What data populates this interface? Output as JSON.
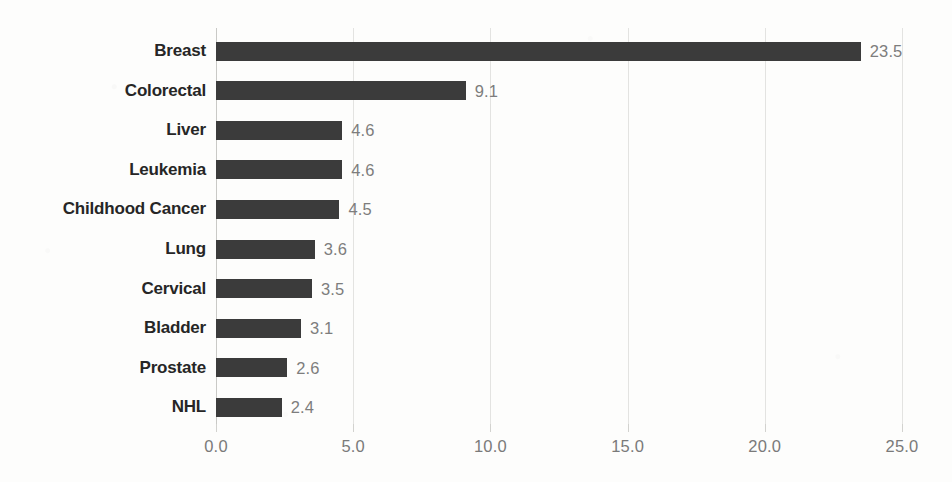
{
  "chart_data": {
    "type": "bar",
    "orientation": "horizontal",
    "title": "",
    "subtitle": "",
    "xlabel": "",
    "ylabel": "",
    "xlim": [
      0.0,
      25.0
    ],
    "grid": true,
    "legend": null,
    "legend_position": "none",
    "xticks": [
      "0.0",
      "5.0",
      "10.0",
      "15.0",
      "20.0",
      "25.0"
    ],
    "xtick_values": [
      0.0,
      5.0,
      10.0,
      15.0,
      20.0,
      25.0
    ],
    "categories": [
      "Breast",
      "Colorectal",
      "Liver",
      "Leukemia",
      "Childhood Cancer",
      "Lung",
      "Cervical",
      "Bladder",
      "Prostate",
      "NHL"
    ],
    "values": [
      23.5,
      9.1,
      4.6,
      4.6,
      4.5,
      3.6,
      3.5,
      3.1,
      2.6,
      2.4
    ],
    "value_labels": [
      "23.5",
      "9.1",
      "4.6",
      "4.6",
      "4.5",
      "3.6",
      "3.5",
      "3.1",
      "2.6",
      "2.4"
    ],
    "bars": [
      {
        "category": "Breast",
        "value": 23.5,
        "label": "23.5"
      },
      {
        "category": "Colorectal",
        "value": 9.1,
        "label": "9.1"
      },
      {
        "category": "Liver",
        "value": 4.6,
        "label": "4.6"
      },
      {
        "category": "Leukemia",
        "value": 4.6,
        "label": "4.6"
      },
      {
        "category": "Childhood Cancer",
        "value": 4.5,
        "label": "4.5"
      },
      {
        "category": "Lung",
        "value": 3.6,
        "label": "3.6"
      },
      {
        "category": "Cervical",
        "value": 3.5,
        "label": "3.5"
      },
      {
        "category": "Bladder",
        "value": 3.1,
        "label": "3.1"
      },
      {
        "category": "Prostate",
        "value": 2.6,
        "label": "2.6"
      },
      {
        "category": "NHL",
        "value": 2.4,
        "label": "2.4"
      }
    ],
    "colors": {
      "bar": "#3b3b3b",
      "gridline": "#e3e3e1",
      "axis": "#c9c9c6",
      "category_label": "#262626",
      "value_label": "#7d7d7d",
      "tick_label": "#7a7a7a",
      "background": "#fdfdfc"
    }
  }
}
